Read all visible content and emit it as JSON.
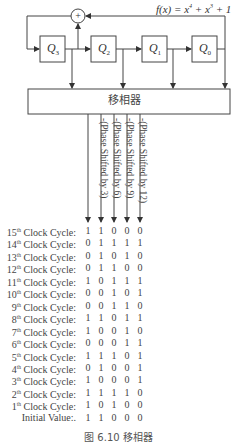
{
  "diagram": {
    "type": "LFSR with phase shifter",
    "polynomial": "f(x) = x⁴ + x³ + 1",
    "polynomial_parts": {
      "prefix": "f(x) = x",
      "exp1": "4",
      "mid": " + x",
      "exp2": "3",
      "suffix": " + 1"
    },
    "xor_symbol": "+",
    "registers": [
      {
        "name": "Q",
        "sub": "3"
      },
      {
        "name": "Q",
        "sub": "2"
      },
      {
        "name": "Q",
        "sub": "1"
      },
      {
        "name": "Q",
        "sub": "0"
      }
    ],
    "phase_shifter_label": "移相器",
    "output_labels": [
      "-(Phase Shifted by 3)",
      "-(Phase Shifted by 6)",
      "-(Phase Shifted by 9)",
      "-(Phase Shifted by 12)"
    ]
  },
  "table": {
    "rows": [
      {
        "n": "15",
        "sup": "th",
        "label": " Clock Cycle:",
        "values": [
          "1",
          "1",
          "0",
          "0",
          "0"
        ]
      },
      {
        "n": "14",
        "sup": "th",
        "label": " Clock Cycle:",
        "values": [
          "0",
          "1",
          "1",
          "1",
          "1"
        ]
      },
      {
        "n": "13",
        "sup": "th",
        "label": " Clock Cycle:",
        "values": [
          "0",
          "1",
          "0",
          "1",
          "0"
        ]
      },
      {
        "n": "12",
        "sup": "th",
        "label": " Clock Cycle:",
        "values": [
          "0",
          "1",
          "1",
          "0",
          "0"
        ]
      },
      {
        "n": "11",
        "sup": "th",
        "label": " Clock Cycle:",
        "values": [
          "1",
          "0",
          "1",
          "1",
          "1"
        ]
      },
      {
        "n": "10",
        "sup": "th",
        "label": " Clock Cycle:",
        "values": [
          "0",
          "0",
          "1",
          "0",
          "1"
        ]
      },
      {
        "n": "9",
        "sup": "th",
        "label": " Clock Cycle:",
        "values": [
          "0",
          "0",
          "1",
          "1",
          "0"
        ]
      },
      {
        "n": "8",
        "sup": "th",
        "label": " Clock Cycle:",
        "values": [
          "1",
          "1",
          "0",
          "1",
          "1"
        ]
      },
      {
        "n": "7",
        "sup": "th",
        "label": " Clock Cycle:",
        "values": [
          "1",
          "0",
          "0",
          "1",
          "0"
        ]
      },
      {
        "n": "6",
        "sup": "th",
        "label": " Clock Cycle:",
        "values": [
          "0",
          "0",
          "0",
          "1",
          "1"
        ]
      },
      {
        "n": "5",
        "sup": "th",
        "label": " Clock Cycle:",
        "values": [
          "1",
          "1",
          "1",
          "0",
          "1"
        ]
      },
      {
        "n": "4",
        "sup": "th",
        "label": " Clock Cycle:",
        "values": [
          "0",
          "1",
          "0",
          "0",
          "1"
        ]
      },
      {
        "n": "3",
        "sup": "th",
        "label": " Clock Cycle:",
        "values": [
          "1",
          "0",
          "0",
          "0",
          "1"
        ]
      },
      {
        "n": "2",
        "sup": "th",
        "label": " Clock Cycle:",
        "values": [
          "1",
          "1",
          "1",
          "1",
          "0"
        ]
      },
      {
        "n": "1",
        "sup": "th",
        "label": " Clock Cycle:",
        "values": [
          "1",
          "0",
          "1",
          "0",
          "0"
        ]
      },
      {
        "n": "",
        "sup": "",
        "label": "Initial Value:.",
        "values": [
          "1",
          "1",
          "0",
          "0",
          "0"
        ]
      }
    ]
  },
  "caption": "图 6.10   移相器"
}
